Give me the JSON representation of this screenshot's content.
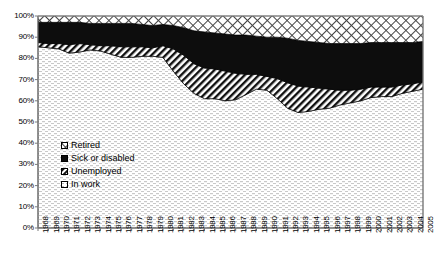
{
  "chart_data": {
    "type": "area",
    "title": "",
    "subtitle": "",
    "xlabel": "",
    "ylabel": "",
    "stacked_100_percent": true,
    "grid": false,
    "legend_position": "inside-lower-left",
    "ylim": [
      0,
      100
    ],
    "ytick_labels": [
      "0%",
      "10%",
      "20%",
      "30%",
      "40%",
      "50%",
      "60%",
      "70%",
      "80%",
      "90%",
      "100%"
    ],
    "ytick_values": [
      0,
      10,
      20,
      30,
      40,
      50,
      60,
      70,
      80,
      90,
      100
    ],
    "categories": [
      "1968",
      "1969",
      "1970",
      "1971",
      "1972",
      "1973",
      "1974",
      "1975",
      "1976",
      "1977",
      "1978",
      "1979",
      "1980",
      "1981",
      "1982",
      "1983",
      "1984",
      "1985",
      "1986",
      "1987",
      "1988",
      "1989",
      "1990",
      "1991",
      "1992",
      "1993",
      "1994",
      "1995",
      "1996",
      "1997",
      "1998",
      "1999",
      "2000",
      "2001",
      "2002",
      "2003",
      "2004",
      "2005"
    ],
    "series": [
      {
        "name": "In work",
        "pattern": "light-dots",
        "order": 1,
        "values": [
          85.5,
          85.0,
          84.5,
          82.5,
          83.0,
          84.0,
          83.5,
          82.0,
          80.5,
          80.5,
          81.0,
          81.0,
          80.5,
          74.0,
          68.0,
          63.5,
          61.0,
          61.0,
          60.0,
          60.5,
          63.0,
          65.5,
          65.0,
          61.0,
          56.5,
          54.5,
          55.0,
          56.0,
          56.5,
          58.0,
          59.0,
          60.0,
          61.5,
          62.0,
          62.0,
          63.5,
          64.5,
          65.5
        ]
      },
      {
        "name": "Unemployed",
        "pattern": "diagonal-stripes",
        "order": 2,
        "values": [
          2.0,
          2.0,
          2.5,
          4.0,
          4.0,
          2.5,
          2.5,
          4.0,
          5.0,
          5.0,
          4.5,
          4.0,
          5.5,
          10.5,
          13.5,
          14.0,
          14.5,
          14.0,
          14.0,
          12.5,
          9.5,
          7.0,
          6.5,
          9.5,
          12.0,
          12.5,
          11.5,
          10.0,
          9.0,
          7.0,
          6.0,
          5.5,
          5.0,
          4.5,
          4.5,
          4.0,
          3.5,
          3.5
        ]
      },
      {
        "name": "Sick or disabled",
        "pattern": "solid-black",
        "order": 3,
        "values": [
          9.5,
          10.0,
          10.0,
          10.5,
          10.0,
          10.0,
          10.5,
          10.5,
          11.0,
          11.0,
          10.5,
          10.5,
          10.0,
          11.0,
          13.0,
          15.5,
          17.0,
          17.0,
          17.5,
          18.0,
          18.5,
          18.0,
          18.5,
          19.5,
          21.0,
          21.5,
          21.5,
          21.5,
          21.5,
          22.0,
          22.0,
          21.5,
          21.0,
          21.0,
          21.0,
          20.0,
          19.5,
          19.0
        ]
      },
      {
        "name": "Retired",
        "pattern": "cross-hatch",
        "order": 4,
        "values": [
          3.0,
          3.0,
          3.0,
          3.0,
          3.0,
          3.5,
          3.5,
          3.5,
          3.5,
          3.5,
          4.0,
          4.5,
          4.0,
          4.5,
          5.5,
          7.0,
          7.5,
          8.0,
          8.5,
          9.0,
          9.0,
          9.5,
          10.0,
          10.0,
          10.5,
          11.5,
          12.0,
          12.5,
          13.0,
          13.0,
          13.0,
          13.0,
          12.5,
          12.5,
          12.5,
          12.5,
          12.5,
          12.0
        ]
      }
    ],
    "legend_entries": [
      {
        "label": "Retired",
        "pattern": "cross-hatch"
      },
      {
        "label": "Sick or disabled",
        "pattern": "solid-black"
      },
      {
        "label": "Unemployed",
        "pattern": "diagonal-stripes"
      },
      {
        "label": "In work",
        "pattern": "light-dots"
      }
    ],
    "colors": {
      "ink": "#000000",
      "background": "#ffffff",
      "axis": "#808080"
    }
  }
}
